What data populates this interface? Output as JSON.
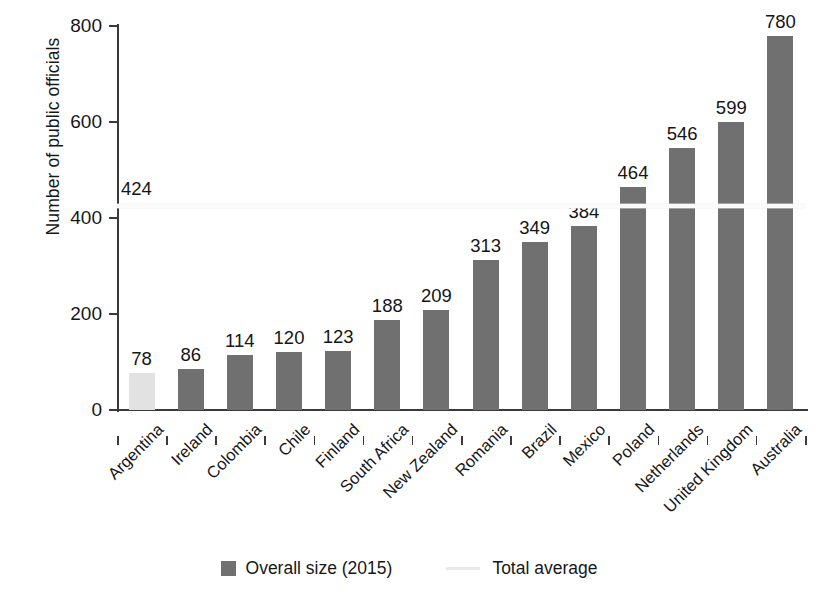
{
  "chart_data": {
    "type": "bar",
    "title": "",
    "xlabel": "",
    "ylabel": "Number of public officials",
    "ylim": [
      0,
      800
    ],
    "yticks": [
      0,
      200,
      400,
      600,
      800
    ],
    "grid": false,
    "legend_position": "bottom",
    "categories": [
      "Argentina",
      "Ireland",
      "Colombia",
      "Chile",
      "Finland",
      "South Africa",
      "New Zealand",
      "Romania",
      "Brazil",
      "Mexico",
      "Poland",
      "Netherlands",
      "United Kingdom",
      "Australia"
    ],
    "values": [
      78,
      86,
      114,
      120,
      123,
      188,
      209,
      313,
      349,
      384,
      464,
      546,
      599,
      780
    ],
    "highlight_index": 0,
    "series": [
      {
        "name": "Overall size (2015)",
        "values": [
          78,
          86,
          114,
          120,
          123,
          188,
          209,
          313,
          349,
          384,
          464,
          546,
          599,
          780
        ]
      }
    ],
    "reference_line": {
      "name": "Total average",
      "value": 424,
      "label": "424"
    },
    "colors": {
      "bar": "#707070",
      "bar_highlight": "#e2e2e2",
      "average_line": "#fbfbfb",
      "axis": "#3a3a3a",
      "text": "#171717"
    }
  },
  "legend": {
    "items": [
      {
        "label": "Overall size (2015)",
        "marker": "bar-swatch-icon"
      },
      {
        "label": "Total average",
        "marker": "line-swatch-icon"
      }
    ]
  }
}
